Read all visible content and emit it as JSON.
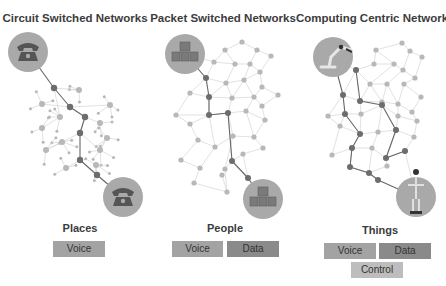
{
  "panels": [
    {
      "title": "Circuit Switched Networks",
      "category": "Places",
      "endpoint_icon": "telephone-icon",
      "chips": [
        {
          "label": "Voice",
          "kind": "voice"
        }
      ]
    },
    {
      "title": "Packet Switched Networks",
      "category": "People",
      "endpoint_icon": "boxes-icon",
      "chips": [
        {
          "label": "Voice",
          "kind": "voice"
        },
        {
          "label": "Data",
          "kind": "data"
        }
      ]
    },
    {
      "title": "Computing Centric Networks",
      "category": "Things",
      "endpoint_icon": "robot-icon",
      "chips": [
        {
          "label": "Voice",
          "kind": "voice"
        },
        {
          "label": "Data",
          "kind": "data"
        },
        {
          "label": "Control",
          "kind": "control"
        }
      ]
    }
  ],
  "colors": {
    "node_light": "#b8b8b8",
    "node_dark": "#6d6d6d",
    "edge_light": "#d4d4d4",
    "edge_dark": "#666666",
    "endpoint_circle": "#a9a9a9",
    "voice_chip": "#a3a3a3",
    "data_chip": "#8a8a8a",
    "control_chip": "#bdbdbd"
  }
}
